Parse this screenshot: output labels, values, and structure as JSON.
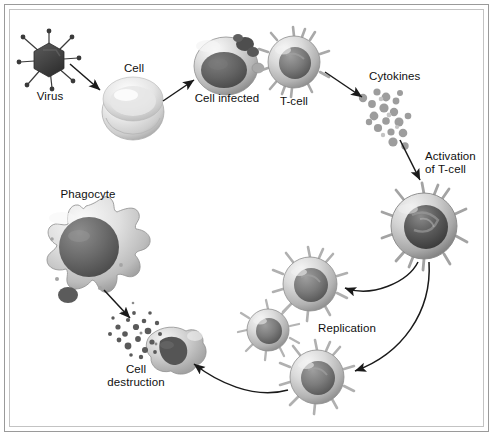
{
  "figure": {
    "domain": "Diagram",
    "background_color": "#ffffff",
    "frame_color": "#9a9a9a",
    "frame_inner_color": "#c3c3c3",
    "text_color": "#101010",
    "ink_color": "#1a1a1a"
  },
  "labels": {
    "virus": "Virus",
    "cell": "Cell",
    "cell_infected": "Cell infected",
    "t_cell": "T-cell",
    "cytokines": "Cytokines",
    "activation_line1": "Activation",
    "activation_line2": "of T-cell",
    "replication": "Replication",
    "phagocyte": "Phagocyte",
    "destruction_line1": "Cell",
    "destruction_line2": "destruction"
  },
  "nodes": [
    {
      "id": "virus",
      "label": "Virus",
      "shape": "hexagon-with-spikes",
      "cx": 49,
      "cy": 60,
      "r": 17,
      "fill": "#4a4a4a"
    },
    {
      "id": "cell",
      "label": "Cell",
      "shape": "sphere",
      "cx": 133,
      "cy": 110,
      "r": 30,
      "fill": "#d9d9d9"
    },
    {
      "id": "cell-infected",
      "label": "Cell infected",
      "shape": "sphere-with-nucleus",
      "cx": 226,
      "cy": 65,
      "r": 31,
      "fill": "#c7c7c7"
    },
    {
      "id": "t-cell",
      "label": "T-cell",
      "shape": "spiky-cell",
      "cx": 294,
      "cy": 62,
      "r": 26,
      "fill": "#cfcfcf"
    },
    {
      "id": "cytokines",
      "label": "Cytokines",
      "shape": "dot-cluster",
      "cx": 392,
      "cy": 115,
      "r": 30,
      "fill": "#b0b0b0"
    },
    {
      "id": "activated-t",
      "label": "Activation of T-cell",
      "shape": "spiky-cell",
      "cx": 424,
      "cy": 226,
      "r": 33,
      "fill": "#bdbdbd"
    },
    {
      "id": "replicate-1",
      "label": "Replication",
      "shape": "spiky-cell",
      "cx": 310,
      "cy": 284,
      "r": 27,
      "fill": "#c9c9c9"
    },
    {
      "id": "replicate-2",
      "label": "Replication",
      "shape": "spiky-cell",
      "cx": 268,
      "cy": 330,
      "r": 21,
      "fill": "#cccccc"
    },
    {
      "id": "replicate-3",
      "label": "Replication",
      "shape": "spiky-cell",
      "cx": 317,
      "cy": 377,
      "r": 27,
      "fill": "#c9c9c9"
    },
    {
      "id": "phagocyte",
      "label": "Phagocyte",
      "shape": "amoeboid",
      "cx": 86,
      "cy": 252,
      "r": 46,
      "fill": "#d2d2d2"
    },
    {
      "id": "destroyed",
      "label": "Cell destruction",
      "shape": "lysed-blob",
      "cx": 170,
      "cy": 352,
      "r": 25,
      "fill": "#b9b9b9"
    }
  ],
  "edges": [
    {
      "from": "virus",
      "to": "cell",
      "style": "straight-arrow"
    },
    {
      "from": "cell",
      "to": "cell-infected",
      "style": "straight-arrow"
    },
    {
      "from": "t-cell",
      "to": "cytokines",
      "style": "straight-arrow"
    },
    {
      "from": "cytokines",
      "to": "activated-t",
      "style": "straight-arrow"
    },
    {
      "from": "activated-t",
      "to": "replicate-1",
      "style": "curved-arrow"
    },
    {
      "from": "activated-t",
      "to": "replicate-3",
      "style": "curved-arrow"
    },
    {
      "from": "replicate-3",
      "to": "destroyed",
      "style": "curved-arrow"
    },
    {
      "from": "phagocyte",
      "to": "destroyed",
      "style": "straight-arrow"
    }
  ]
}
